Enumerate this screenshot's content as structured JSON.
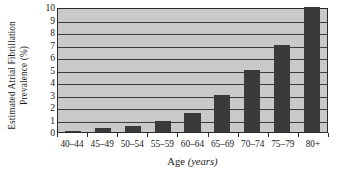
{
  "chart_data": {
    "type": "bar",
    "title": "",
    "subtitle": "",
    "xlabel_text": "Age",
    "xlabel_unit": "(years)",
    "xlabel_full": "Age (years)",
    "ylabel_line1": "Estimated Atrial Fibrillation",
    "ylabel_line2": "Prevalence (%)",
    "ylabel_full": "Estimated Atrial Fibrillation Prevalence (%)",
    "categories": [
      "40–44",
      "45–49",
      "50–54",
      "55–59",
      "60–64",
      "65–69",
      "70–74",
      "75–79",
      "80+"
    ],
    "values": [
      0.1,
      0.3,
      0.5,
      0.85,
      1.5,
      3.0,
      5.0,
      7.0,
      10.0
    ],
    "ylim": [
      0,
      10
    ],
    "yticks": [
      0,
      1,
      2,
      3,
      4,
      5,
      6,
      7,
      8,
      9,
      10
    ],
    "ytick_labels": [
      "0",
      "1",
      "2",
      "3",
      "4",
      "5",
      "6",
      "7",
      "8",
      "9",
      "10"
    ],
    "grid": true,
    "grid_axis": "y",
    "legend": false,
    "legend_position": "none",
    "bar_color": "#3a3a3a",
    "plot_background": "#c9c9c9",
    "grid_color": "#3d3d3d",
    "axis_color": "#2b2b2b",
    "figure_background": "#ffffff"
  }
}
